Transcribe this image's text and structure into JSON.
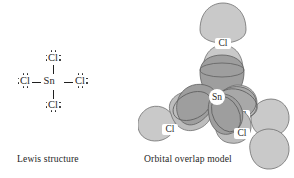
{
  "figure": {
    "panels": [
      {
        "id": "lewis",
        "caption": "Lewis structure"
      },
      {
        "id": "orbital",
        "caption": "Orbital overlap model"
      }
    ]
  },
  "lewis": {
    "caption": "Lewis structure",
    "center_atom": "Sn",
    "atoms": [
      {
        "id": "cl-top",
        "label": "Cl"
      },
      {
        "id": "cl-left",
        "label": "Cl"
      },
      {
        "id": "cl-right",
        "label": "Cl"
      },
      {
        "id": "cl-bottom",
        "label": "Cl"
      }
    ],
    "bond_count": 4,
    "lone_pairs_per_cl": 3
  },
  "orbital": {
    "caption": "Orbital overlap model",
    "center_label": "Sn",
    "chlorine_labels": [
      "Cl",
      "Cl",
      "Cl",
      "Cl"
    ],
    "cl_top_label": "Cl",
    "cl_left_label": "Cl",
    "cl_right_upper_label": "Cl",
    "cl_right_lower_label": "Cl",
    "colors": {
      "cl_orbital_fill": "#c9c9c9",
      "sn_orbital_fill": "#9e9e9e",
      "outline": "#6b6b6b",
      "label_text": "#1f1f1f",
      "background": "#ffffff"
    }
  }
}
